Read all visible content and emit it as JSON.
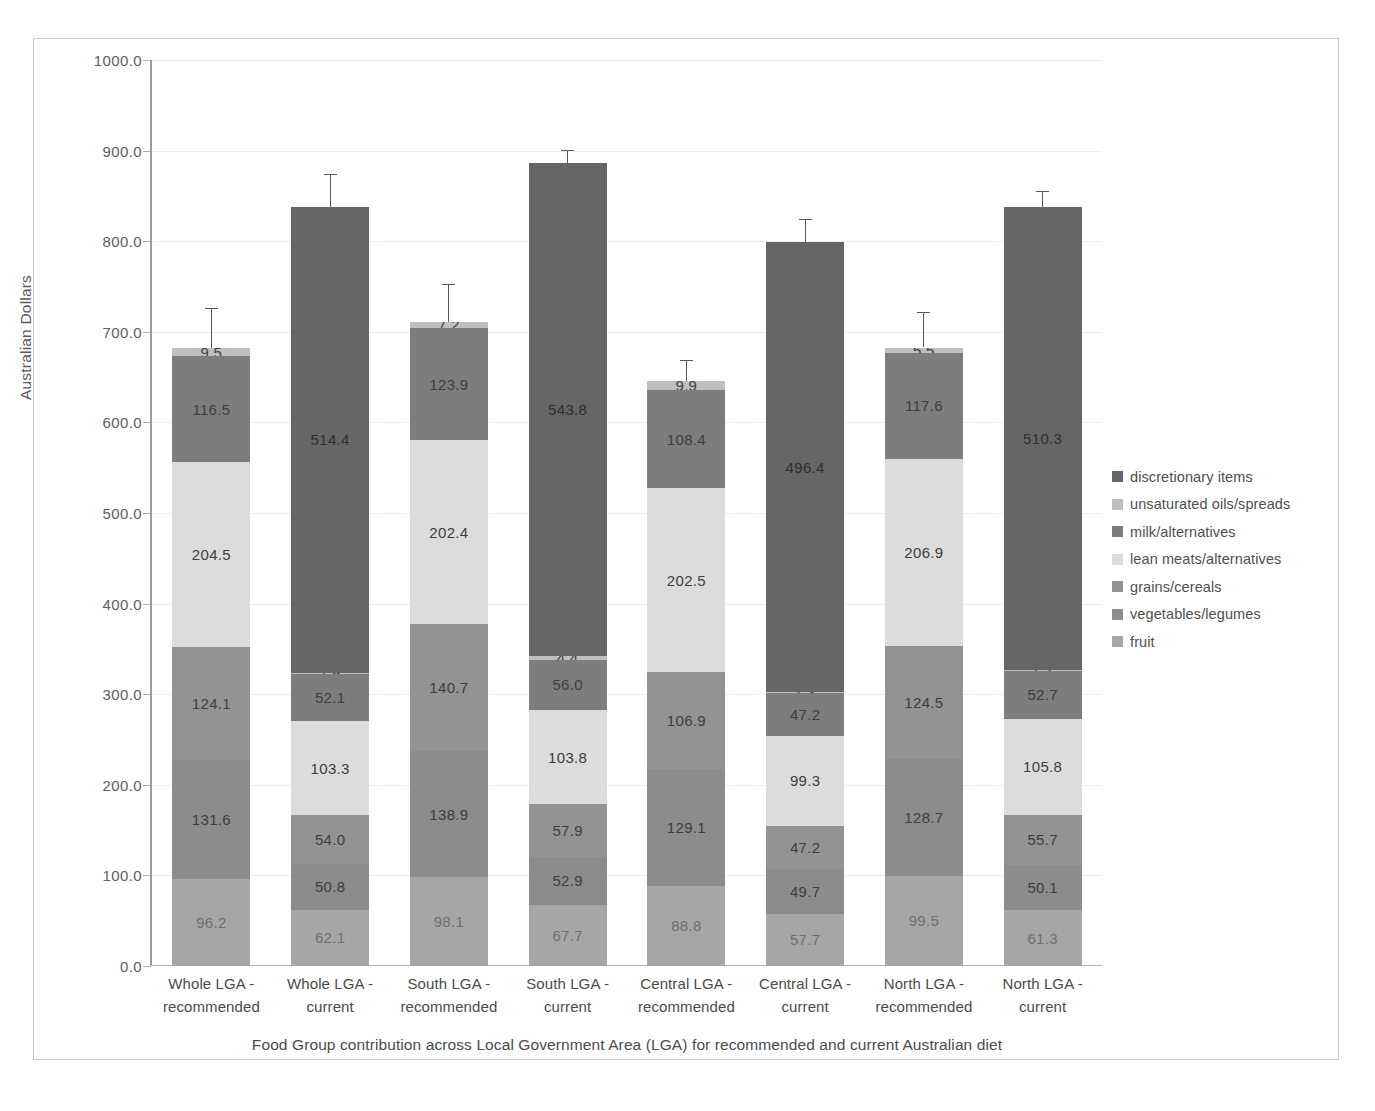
{
  "chart_data": {
    "type": "bar",
    "subtype": "stacked-bar-with-error-bars",
    "title": "",
    "xlabel": "Food Group contribution across Local Government Area (LGA) for recommended and current Australian diet",
    "ylabel": "Australian Dollars",
    "ylim": [
      0,
      1000
    ],
    "ytick_values": [
      0,
      100,
      200,
      300,
      400,
      500,
      600,
      700,
      800,
      900,
      1000
    ],
    "ytick_labels": [
      "0.0",
      "100.0",
      "200.0",
      "300.0",
      "400.0",
      "500.0",
      "600.0",
      "700.0",
      "800.0",
      "900.0",
      "1000.0"
    ],
    "grid": true,
    "legend_position": "right",
    "categories": [
      "Whole LGA - recommended",
      "Whole LGA - current",
      "South LGA - recommended",
      "South LGA - current",
      "Central LGA - recommended",
      "Central LGA - current",
      "North LGA - recommended",
      "North LGA - current"
    ],
    "category_lines": [
      [
        "Whole LGA -",
        "recommended"
      ],
      [
        "Whole LGA -",
        "current"
      ],
      [
        "South LGA -",
        "recommended"
      ],
      [
        "South LGA -",
        "current"
      ],
      [
        "Central LGA -",
        "recommended"
      ],
      [
        "Central LGA -",
        "current"
      ],
      [
        "North LGA -",
        "recommended"
      ],
      [
        "North LGA -",
        "current"
      ]
    ],
    "series": [
      {
        "name": "fruit",
        "color": "#a6a6a6",
        "label_color": "light",
        "values": [
          96.2,
          62.1,
          98.1,
          67.7,
          88.8,
          57.7,
          99.5,
          61.3
        ],
        "labels": [
          "96.2",
          "62.1",
          "98.1",
          "67.7",
          "88.8",
          "57.7",
          "99.5",
          "61.3"
        ]
      },
      {
        "name": "vegetables/legumes",
        "color": "#8c8c8c",
        "label_color": "dark",
        "values": [
          131.6,
          50.8,
          138.9,
          52.9,
          129.1,
          49.7,
          128.7,
          50.1
        ],
        "labels": [
          "131.6",
          "50.8",
          "138.9",
          "52.9",
          "129.1",
          "49.7",
          "128.7",
          "50.1"
        ]
      },
      {
        "name": "grains/cereals",
        "color": "#939393",
        "label_color": "dark",
        "values": [
          124.1,
          54.0,
          140.7,
          57.9,
          106.9,
          47.2,
          124.5,
          55.7
        ],
        "labels": [
          "124.1",
          "54.0",
          "140.7",
          "57.9",
          "106.9",
          "47.2",
          "124.5",
          "55.7"
        ]
      },
      {
        "name": "lean meats/alternatives",
        "color": "#dcdcdc",
        "label_color": "dark",
        "values": [
          204.5,
          103.3,
          202.4,
          103.8,
          202.5,
          99.3,
          206.9,
          105.8
        ],
        "labels": [
          "204.5",
          "103.3",
          "202.4",
          "103.8",
          "202.5",
          "99.3",
          "206.9",
          "105.8"
        ]
      },
      {
        "name": "milk/alternatives",
        "color": "#7d7d7d",
        "label_color": "dark",
        "values": [
          116.5,
          52.1,
          123.9,
          56.0,
          108.4,
          47.2,
          117.6,
          52.7
        ],
        "labels": [
          "116.5",
          "52.1",
          "123.9",
          "56.0",
          "108.4",
          "47.2",
          "117.6",
          "52.7"
        ]
      },
      {
        "name": "unsaturated oils/spreads",
        "color": "#bfbfbf",
        "label_color": "dark",
        "values": [
          9.5,
          1.5,
          7.2,
          4.4,
          9.9,
          1.3,
          5.5,
          1.7
        ],
        "labels": [
          "9.5",
          "1.5",
          "7.2",
          "4.4",
          "9.9",
          "1.3",
          "5.5",
          "1.7"
        ]
      },
      {
        "name": "discretionary items",
        "color": "#666666",
        "label_color": "onblack",
        "values": [
          0,
          514.4,
          0,
          543.8,
          0,
          496.4,
          0,
          510.3
        ],
        "labels": [
          "",
          "514.4",
          "",
          "543.8",
          "",
          "496.4",
          "",
          "510.3"
        ]
      }
    ],
    "totals": [
      682.4,
      838.2,
      711.2,
      882.5,
      645.6,
      798.8,
      682.7,
      837.6
    ],
    "error_bars": [
      {
        "total": 682.4,
        "upper": 726.0
      },
      {
        "total": 838.2,
        "upper": 874.0
      },
      {
        "total": 711.2,
        "upper": 753.0
      },
      {
        "total": 882.5,
        "upper": 901.0
      },
      {
        "total": 645.6,
        "upper": 669.0
      },
      {
        "total": 798.8,
        "upper": 824.0
      },
      {
        "total": 682.7,
        "upper": 722.0
      },
      {
        "total": 837.6,
        "upper": 855.0
      }
    ]
  },
  "legend": {
    "items": [
      {
        "label": "discretionary items",
        "color": "#666666"
      },
      {
        "label": "unsaturated oils/spreads",
        "color": "#bfbfbf"
      },
      {
        "label": "milk/alternatives",
        "color": "#7d7d7d"
      },
      {
        "label": "lean meats/alternatives",
        "color": "#dcdcdc"
      },
      {
        "label": "grains/cereals",
        "color": "#939393"
      },
      {
        "label": "vegetables/legumes",
        "color": "#8c8c8c"
      },
      {
        "label": "fruit",
        "color": "#a6a6a6"
      }
    ]
  }
}
